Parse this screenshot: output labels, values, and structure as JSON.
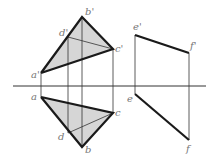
{
  "diagram": {
    "type": "orthographic-projection",
    "colors": {
      "line": "#1a1a1a",
      "thin": "#333333",
      "fill": "#d6d6d6",
      "label": "#777777"
    },
    "axis": {
      "x1": 13,
      "x2": 206,
      "y": 86
    },
    "labels": {
      "a_prime": "a'",
      "b_prime": "b'",
      "c_prime": "c'",
      "d_prime": "d'",
      "e_prime": "e'",
      "f_prime": "f'",
      "a": "a",
      "b": "b",
      "c": "c",
      "d": "d",
      "e": "e",
      "f": "f"
    },
    "front_view": {
      "a": [
        41,
        73
      ],
      "b": [
        82,
        17
      ],
      "c": [
        113,
        49
      ],
      "d": [
        68,
        37
      ]
    },
    "top_view": {
      "a": [
        41,
        97
      ],
      "b": [
        82,
        147
      ],
      "c": [
        113,
        113
      ],
      "d": [
        68,
        133
      ]
    },
    "line_ef": {
      "e_prime": [
        135,
        35
      ],
      "f_prime": [
        189,
        53
      ],
      "e": [
        135,
        94
      ],
      "f": [
        189,
        140
      ]
    }
  }
}
